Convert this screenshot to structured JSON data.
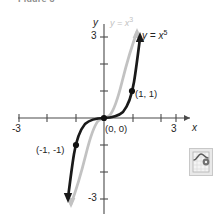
{
  "caption": {
    "text": "Figure 3"
  },
  "chart_data": {
    "type": "line",
    "title": "",
    "subtitle": "",
    "xlabel": "x",
    "ylabel": "y",
    "xlim": [
      -3.6,
      3.6
    ],
    "ylim": [
      -3.6,
      3.6
    ],
    "grid": false,
    "legend_position": "inline-at-curve-end",
    "x_ticks": [
      -3,
      -2,
      -1,
      1,
      2,
      3
    ],
    "x_tick_labels": [
      "-3",
      "",
      "",
      "",
      "",
      "3"
    ],
    "y_ticks": [
      -3,
      -2,
      -1,
      1,
      2,
      3
    ],
    "y_tick_labels": [
      "-3",
      "",
      "",
      "",
      "",
      "3"
    ],
    "axis_label_x": "x",
    "axis_label_y": "y",
    "series": [
      {
        "name": "y = x³",
        "label_html": "y = x<sup>3</sup>",
        "color": "#c2c2c2",
        "style": "solid",
        "width": 2.6,
        "arrows": "both",
        "x": [
          -1.38,
          -1.3,
          -1.2,
          -1.1,
          -1.0,
          -0.9,
          -0.8,
          -0.7,
          -0.6,
          -0.5,
          -0.4,
          -0.3,
          -0.2,
          -0.1,
          0,
          0.1,
          0.2,
          0.3,
          0.4,
          0.5,
          0.6,
          0.7,
          0.8,
          0.9,
          1.0,
          1.1,
          1.2,
          1.3,
          1.38
        ],
        "y": [
          -2.63,
          -2.197,
          -1.728,
          -1.331,
          -1.0,
          -0.729,
          -0.512,
          -0.343,
          -0.216,
          -0.125,
          -0.064,
          -0.027,
          -0.008,
          -0.001,
          0,
          0.001,
          0.008,
          0.027,
          0.064,
          0.125,
          0.216,
          0.343,
          0.512,
          0.729,
          1.0,
          1.331,
          1.728,
          2.197,
          2.63
        ]
      },
      {
        "name": "y = x⁵",
        "label_html": "y = x<sup>5</sup>",
        "color": "#1a1a1a",
        "style": "solid",
        "width": 2.6,
        "arrows": "both",
        "x": [
          -1.24,
          -1.2,
          -1.15,
          -1.1,
          -1.05,
          -1.0,
          -0.95,
          -0.9,
          -0.85,
          -0.8,
          -0.7,
          -0.6,
          -0.5,
          -0.4,
          -0.3,
          -0.2,
          -0.1,
          0,
          0.1,
          0.2,
          0.3,
          0.4,
          0.5,
          0.6,
          0.7,
          0.8,
          0.85,
          0.9,
          0.95,
          1.0,
          1.05,
          1.1,
          1.15,
          1.2,
          1.24
        ],
        "y": [
          -2.93,
          -2.488,
          -2.011,
          -1.61,
          -1.276,
          -1.0,
          -0.773,
          -0.59,
          -0.443,
          -0.327,
          -0.168,
          -0.077,
          -0.031,
          -0.01,
          -0.002,
          -0.0003,
          0,
          0,
          0,
          0.0003,
          0.002,
          0.01,
          0.031,
          0.077,
          0.168,
          0.327,
          0.443,
          0.59,
          0.773,
          1.0,
          1.276,
          1.61,
          2.011,
          2.488,
          2.93
        ]
      }
    ],
    "points": [
      {
        "label": "(1, 1)",
        "x": 1,
        "y": 1,
        "marker": "filled-circle"
      },
      {
        "label": "(0, 0)",
        "x": 0,
        "y": 0,
        "marker": "filled-circle"
      },
      {
        "label": "(-1, -1)",
        "x": -1,
        "y": -1,
        "marker": "filled-circle"
      }
    ],
    "annotations": [
      {
        "text": "y = x^5",
        "kind": "curve-label",
        "color": "#1a1a1a"
      },
      {
        "text": "y = x^3",
        "kind": "curve-label",
        "color": "#c2c2c2"
      }
    ]
  },
  "labels": {
    "x_neg3": "-3",
    "x_pos3": "3",
    "y_pos3": "3",
    "y_neg3": "-3",
    "axis_x": "x",
    "axis_y": "y",
    "point_origin": "(0, 0)",
    "point_one": "(1, 1)",
    "point_negone": "(-1, -1)"
  },
  "colors": {
    "curve_primary": "#1a1a1a",
    "curve_secondary": "#c2c2c2",
    "axis": "#4a4a4a",
    "background": "#ffffff"
  },
  "calculator_badge": {
    "icon": "graphing-calculator-icon",
    "label": ""
  }
}
